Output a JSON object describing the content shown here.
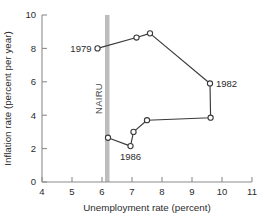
{
  "chart_data": {
    "type": "line",
    "title": "",
    "xlabel": "Unemployment rate (percent)",
    "ylabel": "Inflation rate (percent per year)",
    "xlim": [
      4,
      11
    ],
    "ylim": [
      0,
      10
    ],
    "xticks": [
      "4",
      "5",
      "6",
      "7",
      "8",
      "9",
      "10",
      "11"
    ],
    "yticks": [
      "0",
      "2",
      "4",
      "6",
      "8",
      "10"
    ],
    "grid": false,
    "legend": "none",
    "series": [
      {
        "name": "Phillips curve loop 1979-1986",
        "x": [
          5.85,
          7.15,
          7.6,
          9.6,
          9.62,
          7.5,
          7.05,
          6.95,
          6.2
        ],
        "y": [
          8.0,
          8.65,
          8.9,
          5.9,
          3.85,
          3.7,
          3.0,
          2.15,
          2.65
        ]
      }
    ],
    "annotations": [
      {
        "text": "1979",
        "x": 5.85,
        "y": 8.0,
        "position": "left"
      },
      {
        "text": "1982",
        "x": 9.6,
        "y": 5.9,
        "position": "right"
      },
      {
        "text": "1986",
        "x": 6.95,
        "y": 2.15,
        "position": "below"
      },
      {
        "text": "NAIRU",
        "x": 6.15,
        "y": 5.0,
        "position": "rotated-left-of-band"
      }
    ],
    "vertical_band": {
      "label": "NAIRU",
      "x_start": 6.1,
      "x_end": 6.25,
      "color": "#bdbdbd"
    }
  },
  "style": {
    "axis_color": "#8c8c8c",
    "line_color": "#3a3a3a",
    "marker_fill": "#ffffff",
    "text_color": "#2b2b2b",
    "background": "#ffffff"
  }
}
